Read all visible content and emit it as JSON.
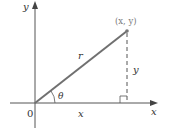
{
  "diagram": {
    "title": "",
    "labels": {
      "y_axis": "y",
      "x_axis": "x",
      "origin": "0",
      "point": "(x, y)",
      "radius": "r",
      "angle": "θ",
      "horizontal_leg": "x",
      "vertical_leg": "y"
    },
    "colors": {
      "axis": "#555555",
      "radius_line": "#707070",
      "dashed_line": "#555555",
      "point": "#777777",
      "text": "#333333",
      "point_label": "#7a7a7a"
    }
  }
}
